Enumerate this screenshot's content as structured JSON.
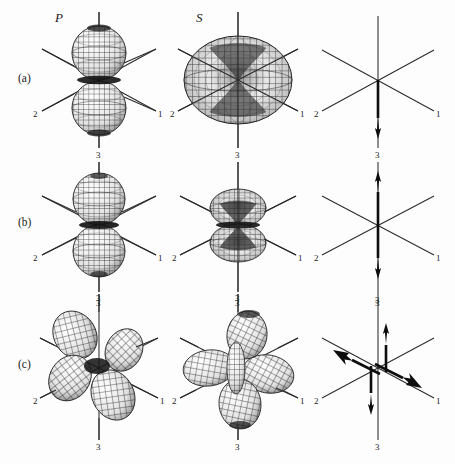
{
  "figure": {
    "kind": "scientific-figure",
    "background_color": "#fdfdfd",
    "ink_color": "#1d1d1d",
    "column_headers": [
      {
        "id": "p-column",
        "label": "P"
      },
      {
        "id": "s-column",
        "label": "S"
      },
      {
        "id": "force-column",
        "label": ""
      }
    ],
    "row_labels": [
      {
        "id": "row-a",
        "label": "(a)"
      },
      {
        "id": "row-b",
        "label": "(b)"
      },
      {
        "id": "row-c",
        "label": "(c)"
      }
    ],
    "axis_labels": {
      "axis1": "1",
      "axis2": "2",
      "axis3": "3"
    },
    "axis_label_sets": {
      "row_a": {
        "left": "2",
        "right": "1",
        "bottom": "3",
        "top": ""
      },
      "row_b": {
        "left": "2",
        "right": "1",
        "bottom": "3",
        "top": ""
      },
      "row_c": {
        "left": "2",
        "right": "1",
        "bottom": "3",
        "top": "3"
      }
    },
    "panels": [
      {
        "id": "panel-a-p",
        "row": "(a)",
        "column": "P",
        "pattern": "two-lobe-dipole-vertical",
        "lobes": 2,
        "description": "Two spherical lobes stacked along axis 3"
      },
      {
        "id": "panel-a-s",
        "row": "(a)",
        "column": "S",
        "pattern": "torus-pinched-center",
        "lobes": 1,
        "description": "Large toroidal surface pinched at origin on axis 3"
      },
      {
        "id": "panel-a-force",
        "row": "(a)",
        "column": "force",
        "pattern": "single-force",
        "arrows": [
          {
            "id": "arrow-down-axis3",
            "direction": "down",
            "axis": "3",
            "offset": "centered",
            "heads": 1
          }
        ],
        "description": "Single force arrow directed down along axis 3"
      },
      {
        "id": "panel-b-p",
        "row": "(b)",
        "column": "P",
        "pattern": "two-lobe-dipole-vertical",
        "lobes": 2,
        "description": "Two spherical lobes stacked along axis 3, pinched at origin"
      },
      {
        "id": "panel-b-s",
        "row": "(b)",
        "column": "S",
        "pattern": "double-torus-stacked",
        "lobes": 2,
        "description": "Two small flattened tori stacked along axis 3"
      },
      {
        "id": "panel-b-force",
        "row": "(b)",
        "column": "force",
        "pattern": "vector-dipole",
        "arrows": [
          {
            "id": "arrow-up-axis3",
            "direction": "up",
            "axis": "3",
            "offset": "centered",
            "heads": 1
          },
          {
            "id": "arrow-down-axis3",
            "direction": "down",
            "axis": "3",
            "offset": "centered",
            "heads": 1
          }
        ],
        "description": "Opposing arrows along axis 3 forming a vector dipole"
      },
      {
        "id": "panel-c-p",
        "row": "(c)",
        "column": "P",
        "pattern": "four-lobe-quadrupole",
        "lobes": 4,
        "description": "Four lobes in the 1-3 plane, quadrupole radiation pattern"
      },
      {
        "id": "panel-c-s",
        "row": "(c)",
        "column": "S",
        "pattern": "multi-lobe-quadrupole",
        "lobes": 6,
        "description": "Multi-lobed quadrupole S radiation pattern"
      },
      {
        "id": "panel-c-force",
        "row": "(c)",
        "column": "force",
        "pattern": "double-couple",
        "arrows": [
          {
            "id": "arrow-up-axis3-right",
            "direction": "up",
            "axis": "3",
            "offset": "right",
            "heads": 1
          },
          {
            "id": "arrow-down-axis3-left",
            "direction": "down",
            "axis": "3",
            "offset": "left",
            "heads": 1
          },
          {
            "id": "arrow-upleft-axis2",
            "direction": "upper-left",
            "axis": "2",
            "offset": "upper",
            "heads": 1
          },
          {
            "id": "arrow-lowright-axis1",
            "direction": "lower-right",
            "axis": "1",
            "offset": "lower",
            "heads": 1
          }
        ],
        "description": "Double couple: two opposing force pairs forming a moment tensor"
      }
    ],
    "caption": ""
  }
}
